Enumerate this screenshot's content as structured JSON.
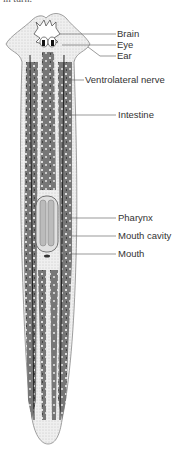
{
  "caption_fragment": "in turn.",
  "diagram": {
    "labels": [
      {
        "id": "brain",
        "text": "Brain",
        "x": 117,
        "y": 29,
        "line_from": [
          60,
          34
        ],
        "line_to": [
          116,
          34
        ]
      },
      {
        "id": "eye",
        "text": "Eye",
        "x": 117,
        "y": 40,
        "line_from": [
          62,
          45
        ],
        "line_to": [
          116,
          45
        ]
      },
      {
        "id": "ear",
        "text": "Ear",
        "x": 117,
        "y": 51,
        "line_from": [
          88,
          47
        ],
        "line_to": [
          116,
          56
        ]
      },
      {
        "id": "ventrolateral-nerve",
        "text": "Ventrolateral nerve",
        "x": 85,
        "y": 75,
        "line_from": [
          68,
          80
        ],
        "line_to": [
          84,
          80
        ]
      },
      {
        "id": "intestine",
        "text": "Intestine",
        "x": 118,
        "y": 110,
        "line_from": [
          70,
          115
        ],
        "line_to": [
          116,
          115
        ]
      },
      {
        "id": "pharynx",
        "text": "Pharynx",
        "x": 118,
        "y": 213,
        "line_from": [
          70,
          218
        ],
        "line_to": [
          116,
          218
        ]
      },
      {
        "id": "mouth-cavity",
        "text": "Mouth cavity",
        "x": 118,
        "y": 231,
        "line_from": [
          72,
          236
        ],
        "line_to": [
          116,
          236
        ]
      },
      {
        "id": "mouth",
        "text": "Mouth",
        "x": 118,
        "y": 249,
        "line_from": [
          70,
          254
        ],
        "line_to": [
          116,
          254
        ]
      }
    ]
  },
  "colors": {
    "outline": "#888888",
    "tissue": "#e6e6e6",
    "intestine": "#6e6e6e",
    "intestine_dark": "#4a4a4a",
    "nerve": "#222222",
    "label_text": "#333333",
    "leader_line": "#555555"
  }
}
